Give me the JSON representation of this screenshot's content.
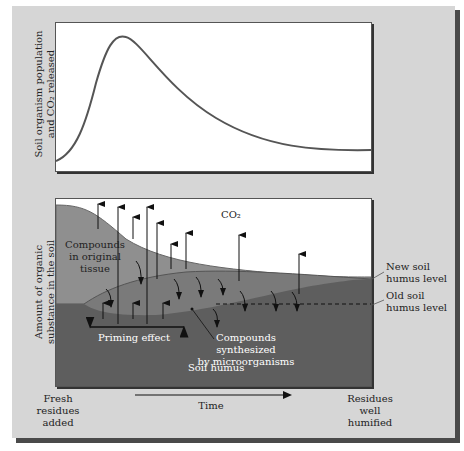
{
  "figure": {
    "top_chart": {
      "ylabel_line1": "Soil organism population",
      "ylabel_line2": "and CO₂ released",
      "curve": "rises sharply to an early peak then decays to a low plateau"
    },
    "bottom_chart": {
      "ylabel_line1": "Amount of organic",
      "ylabel_line2": "substance in the soil",
      "labels": {
        "co2": "CO₂",
        "compounds_original_1": "Compounds",
        "compounds_original_2": "in original",
        "compounds_original_3": "tissue",
        "priming": "Priming effect",
        "synth_1": "Compounds synthesized",
        "synth_2": "by microorganisms",
        "soil_humus": "Soil humus",
        "new_level_1": "New soil",
        "new_level_2": "humus level",
        "old_level_1": "Old soil",
        "old_level_2": "humus level"
      }
    },
    "x_axis": {
      "left_1": "Fresh",
      "left_2": "residues",
      "left_3": "added",
      "center": "Time",
      "right_1": "Residues",
      "right_2": "well",
      "right_3": "humified"
    },
    "colors": {
      "panel": "#d6d6d6",
      "original_tissue": "#8f8f8f",
      "synthesized": "#7a7a7a",
      "humus": "#5e5e5e"
    }
  }
}
